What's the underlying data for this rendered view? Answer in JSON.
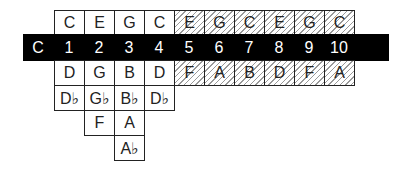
{
  "diagram": {
    "key_label": "C",
    "holes": [
      "1",
      "2",
      "3",
      "4",
      "5",
      "6",
      "7",
      "8",
      "9",
      "10"
    ],
    "blow_notes": [
      "C",
      "E",
      "G",
      "C",
      "E",
      "G",
      "C",
      "E",
      "G",
      "C"
    ],
    "draw_notes": [
      "D",
      "G",
      "B",
      "D",
      "F",
      "A",
      "B",
      "D",
      "F",
      "A"
    ],
    "bend_row1": [
      "D♭",
      "G♭",
      "B♭",
      "D♭"
    ],
    "bend_row2": [
      "F",
      "A"
    ],
    "bend_row3": [
      "A♭"
    ],
    "hatched_from_hole": 5
  }
}
